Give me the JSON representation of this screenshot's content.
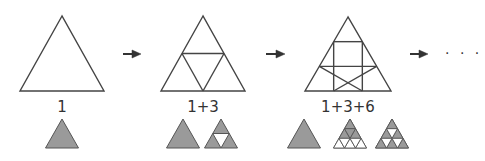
{
  "colors": {
    "stroke": "#444444",
    "fill": "#9a9a9a",
    "small_stroke": "#555555",
    "background": "#ffffff"
  },
  "stages": [
    {
      "label": "1",
      "subdivisions": 1,
      "center_x": 62,
      "triangle": {
        "apex": [
          62,
          16
        ],
        "base_left": [
          20,
          91
        ],
        "base_right": [
          104,
          91
        ]
      },
      "breakdown": [
        {
          "kind": "whole",
          "apex_x": 62
        }
      ]
    },
    {
      "label": "1+3",
      "subdivisions": 2,
      "center_x": 203,
      "triangle": {
        "apex": [
          203,
          16
        ],
        "base_left": [
          161,
          91
        ],
        "base_right": [
          245,
          91
        ]
      },
      "breakdown": [
        {
          "kind": "whole",
          "apex_x": 183
        },
        {
          "kind": "level1",
          "apex_x": 221
        }
      ]
    },
    {
      "label": "1+3+6",
      "subdivisions": 3,
      "center_x": 348,
      "triangle": {
        "apex": [
          348,
          17
        ],
        "base_left": [
          305,
          91
        ],
        "base_right": [
          391,
          91
        ]
      },
      "breakdown": [
        {
          "kind": "whole",
          "apex_x": 304
        },
        {
          "kind": "level1of3",
          "apex_x": 350
        },
        {
          "kind": "level2of3",
          "apex_x": 392
        }
      ]
    }
  ],
  "arrows": [
    {
      "x1": 123,
      "x2": 141,
      "y": 54
    },
    {
      "x1": 266,
      "x2": 285,
      "y": 54
    },
    {
      "x1": 410,
      "x2": 428,
      "y": 54
    }
  ],
  "ellipsis": "· · ·"
}
